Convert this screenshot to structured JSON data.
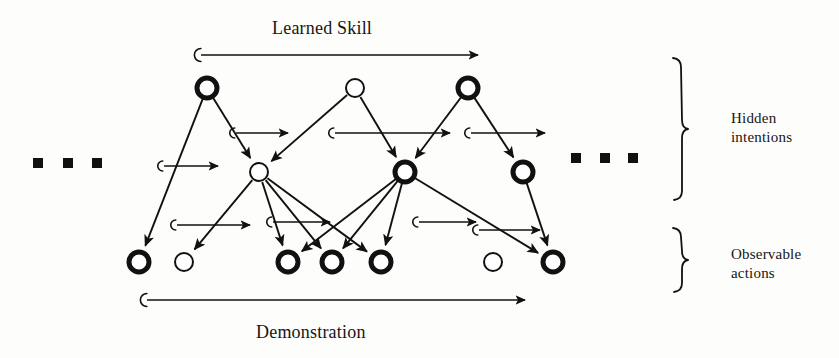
{
  "figure": {
    "title_top": "Learned Skill",
    "title_bottom": "Demonstration",
    "bracket_labels": {
      "hidden_line1": "Hidden",
      "hidden_line2": "intentions",
      "observable_line1": "Observable",
      "observable_line2": "actions"
    },
    "ink_color": "#111111",
    "background_color": "#fdfdfc"
  },
  "chart_data": {
    "type": "diagram",
    "diagram_kind": "dynamic-bayesian-network",
    "layers": [
      {
        "id": "skill",
        "label": "Learned Skill",
        "y": 55
      },
      {
        "id": "intention_top",
        "label": "Hidden intentions (upper)",
        "y": 88
      },
      {
        "id": "intention_mid",
        "label": "Hidden intentions (lower)",
        "y": 172
      },
      {
        "id": "action",
        "label": "Observable actions",
        "y": 262
      },
      {
        "id": "demonstration",
        "label": "Demonstration",
        "y": 300
      }
    ],
    "nodes": [
      {
        "id": "t1",
        "layer": "intention_top",
        "x": 207,
        "y": 88,
        "r": 10,
        "style": "bold"
      },
      {
        "id": "t2",
        "layer": "intention_top",
        "x": 355,
        "y": 88,
        "r": 9,
        "style": "thin"
      },
      {
        "id": "t3",
        "layer": "intention_top",
        "x": 468,
        "y": 88,
        "r": 10,
        "style": "bold"
      },
      {
        "id": "m1",
        "layer": "intention_mid",
        "x": 259,
        "y": 172,
        "r": 9,
        "style": "thin"
      },
      {
        "id": "m2",
        "layer": "intention_mid",
        "x": 405,
        "y": 172,
        "r": 10,
        "style": "bold"
      },
      {
        "id": "m3",
        "layer": "intention_mid",
        "x": 523,
        "y": 172,
        "r": 10,
        "style": "bold"
      },
      {
        "id": "a1",
        "layer": "action",
        "x": 139,
        "y": 262,
        "r": 10,
        "style": "bold"
      },
      {
        "id": "a2",
        "layer": "action",
        "x": 184,
        "y": 262,
        "r": 9,
        "style": "thin"
      },
      {
        "id": "a3",
        "layer": "action",
        "x": 288,
        "y": 262,
        "r": 10,
        "style": "bold"
      },
      {
        "id": "a4",
        "layer": "action",
        "x": 332,
        "y": 262,
        "r": 10,
        "style": "bold"
      },
      {
        "id": "a5",
        "layer": "action",
        "x": 381,
        "y": 262,
        "r": 10,
        "style": "bold"
      },
      {
        "id": "a6",
        "layer": "action",
        "x": 493,
        "y": 262,
        "r": 9,
        "style": "thin"
      },
      {
        "id": "a7",
        "layer": "action",
        "x": 553,
        "y": 262,
        "r": 10,
        "style": "bold"
      }
    ],
    "edges": [
      {
        "from": "t1",
        "to": "m1"
      },
      {
        "from": "t1",
        "to": "a1"
      },
      {
        "from": "t2",
        "to": "m1"
      },
      {
        "from": "t2",
        "to": "m2"
      },
      {
        "from": "t3",
        "to": "m2"
      },
      {
        "from": "t3",
        "to": "m3"
      },
      {
        "from": "m1",
        "to": "a2"
      },
      {
        "from": "m1",
        "to": "a3"
      },
      {
        "from": "m1",
        "to": "a4"
      },
      {
        "from": "m1",
        "to": "a5"
      },
      {
        "from": "m2",
        "to": "a3"
      },
      {
        "from": "m2",
        "to": "a4"
      },
      {
        "from": "m2",
        "to": "a5"
      },
      {
        "from": "m2",
        "to": "a7"
      },
      {
        "from": "m3",
        "to": "a7"
      }
    ],
    "timeline_arrows": [
      {
        "id": "skill-timeline",
        "x1": 196,
        "y1": 55,
        "x2": 478,
        "y2": 55,
        "label": "Learned Skill"
      },
      {
        "id": "demonstration-timeline",
        "x1": 142,
        "y1": 300,
        "x2": 525,
        "y2": 300,
        "label": "Demonstration"
      },
      {
        "id": "intention-top-arrow-1",
        "x1": 231,
        "y1": 133,
        "x2": 288,
        "y2": 133,
        "label": ""
      },
      {
        "id": "intention-top-arrow-2",
        "x1": 330,
        "y1": 133,
        "x2": 450,
        "y2": 133,
        "label": ""
      },
      {
        "id": "intention-top-arrow-3",
        "x1": 466,
        "y1": 133,
        "x2": 545,
        "y2": 133,
        "label": ""
      },
      {
        "id": "intention-mid-arrow-1",
        "x1": 159,
        "y1": 166,
        "x2": 218,
        "y2": 166,
        "label": ""
      },
      {
        "id": "action-arrow-1",
        "x1": 172,
        "y1": 225,
        "x2": 250,
        "y2": 225,
        "label": ""
      },
      {
        "id": "action-arrow-2",
        "x1": 268,
        "y1": 222,
        "x2": 330,
        "y2": 222,
        "label": ""
      },
      {
        "id": "action-arrow-3",
        "x1": 414,
        "y1": 222,
        "x2": 476,
        "y2": 222,
        "label": ""
      },
      {
        "id": "action-arrow-4",
        "x1": 474,
        "y1": 230,
        "x2": 540,
        "y2": 230,
        "label": ""
      }
    ],
    "ellipses": [
      {
        "id": "left-ellipsis",
        "dots": 3,
        "x_positions": [
          38,
          68,
          97
        ],
        "y": 163
      },
      {
        "id": "right-ellipsis",
        "dots": 3,
        "x_positions": [
          576,
          605,
          633
        ],
        "y": 158
      }
    ],
    "brackets": [
      {
        "id": "hidden-intentions",
        "x": 682,
        "y_top": 58,
        "y_bottom": 200,
        "label": "Hidden intentions"
      },
      {
        "id": "observable-actions",
        "x": 682,
        "y_top": 228,
        "y_bottom": 292,
        "label": "Observable actions"
      }
    ]
  }
}
